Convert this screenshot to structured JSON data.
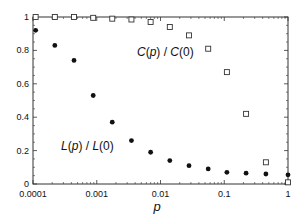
{
  "chart_data": {
    "type": "scatter",
    "title": "",
    "xlabel": "p",
    "ylabel": "",
    "xscale": "log",
    "xlim": [
      0.0001,
      1
    ],
    "ylim": [
      0,
      1
    ],
    "grid": false,
    "legend": "none (inline annotations)",
    "x_ticks": [
      "0.0001",
      "0.001",
      "0.01",
      "0.1",
      "1"
    ],
    "y_ticks": [
      "0",
      "0.2",
      "0.4",
      "0.6",
      "0.8",
      "1"
    ],
    "x": [
      0.00011,
      0.00022,
      0.00044,
      0.00088,
      0.00175,
      0.0035,
      0.007,
      0.014,
      0.028,
      0.056,
      0.11,
      0.22,
      0.45,
      1.0
    ],
    "series": [
      {
        "name": "C(p) / C(0)",
        "marker": "open-square",
        "values": [
          1.0,
          1.0,
          1.0,
          0.995,
          0.99,
          0.985,
          0.97,
          0.94,
          0.89,
          0.81,
          0.67,
          0.42,
          0.13,
          0.01
        ]
      },
      {
        "name": "L(p) / L(0)",
        "marker": "filled-circle",
        "values": [
          0.92,
          0.83,
          0.74,
          0.53,
          0.37,
          0.26,
          0.19,
          0.14,
          0.11,
          0.09,
          0.07,
          0.065,
          0.06,
          0.055
        ]
      }
    ],
    "annotations": [
      {
        "text": "C(p) / C(0)",
        "x": 0.012,
        "y": 0.8
      },
      {
        "text": "L(p) / L(0)",
        "x": 0.00085,
        "y": 0.22
      }
    ]
  },
  "labels": {
    "xlabel": "p",
    "c_label": {
      "f": "C",
      "open": "(",
      "arg": "p",
      "close": ") / ",
      "f2": "C",
      "tail": "(0)"
    },
    "l_label": {
      "f": "L",
      "open": "(",
      "arg": "p",
      "close": ") / ",
      "f2": "L",
      "tail": "(0)"
    }
  }
}
